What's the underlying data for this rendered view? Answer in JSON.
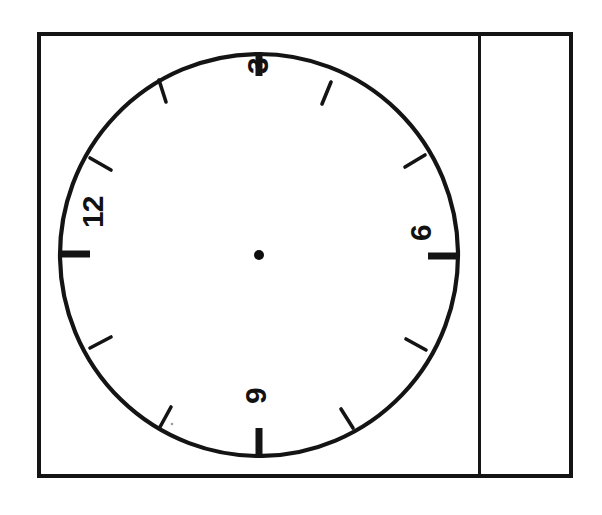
{
  "sheet": {
    "background_color": "#ffffff",
    "frame_color": "#141414",
    "ink_color": "#111111",
    "description": "Hand-drawn clock face on a bordered sheet, scanned sideways"
  },
  "clock": {
    "center": {
      "x": 259,
      "y": 255
    },
    "radius_x": 199,
    "radius_y": 201,
    "center_dot_radius": 5,
    "numerals": [
      {
        "id": "numeral-12",
        "label": "12",
        "position": "left",
        "rotation_deg": -90
      },
      {
        "id": "numeral-3",
        "label": "3",
        "position": "top",
        "rotation_deg": -90
      },
      {
        "id": "numeral-6",
        "label": "6",
        "position": "right",
        "rotation_deg": -90
      },
      {
        "id": "numeral-9",
        "label": "9",
        "position": "bottom",
        "rotation_deg": -90
      }
    ],
    "major_tick_angles_deg": [
      0,
      90,
      180,
      270
    ],
    "minor_tick_angles_deg": [
      30,
      60,
      120,
      150,
      210,
      240,
      300,
      330
    ],
    "hands": [],
    "hand_count": 0
  },
  "margin_rule": {
    "orientation": "vertical",
    "x": 478,
    "color": "#161616"
  }
}
